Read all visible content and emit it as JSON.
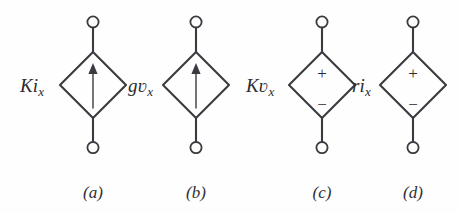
{
  "figure": {
    "background_color": "#fefefe",
    "stroke_color": "#3a3a40",
    "width": 459,
    "height": 213
  },
  "sources": [
    {
      "id": "a",
      "caption": "(a)",
      "label_main": "Ki",
      "label_sub": "x",
      "label_full": "Ki_x",
      "symbol_type": "current-source",
      "marker": "up-arrow",
      "plus": "",
      "minus": "",
      "center_x": 93,
      "caption_x": 93
    },
    {
      "id": "b",
      "caption": "(b)",
      "label_main": "gʋ",
      "label_sub": "x",
      "label_full": "gv_x",
      "symbol_type": "current-source",
      "marker": "up-arrow",
      "plus": "",
      "minus": "",
      "center_x": 196,
      "caption_x": 196
    },
    {
      "id": "c",
      "caption": "(c)",
      "label_main": "Kʋ",
      "label_sub": "x",
      "label_full": "Kv_x",
      "symbol_type": "voltage-source",
      "marker": "plus-minus",
      "plus": "+",
      "minus": "−",
      "center_x": 322,
      "caption_x": 322
    },
    {
      "id": "d",
      "caption": "(d)",
      "label_main": "ri",
      "label_sub": "x",
      "label_full": "ri_x",
      "symbol_type": "voltage-source",
      "marker": "plus-minus",
      "plus": "+",
      "minus": "−",
      "center_x": 413,
      "caption_x": 413
    }
  ]
}
